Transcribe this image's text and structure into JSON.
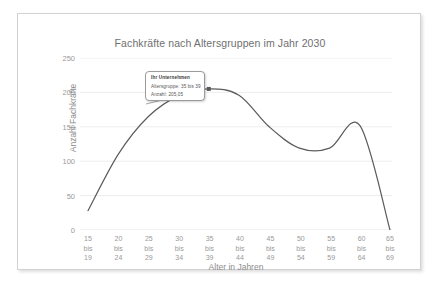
{
  "chart_data": {
    "type": "line",
    "title": "Fachkräfte nach Altersgruppen im Jahr 2030",
    "xlabel": "Alter in Jahren",
    "ylabel": "Anzahl Fachkräfte",
    "categories": [
      "15 bis 19",
      "20 bis 24",
      "25 bis 29",
      "30 bis 34",
      "35 bis 39",
      "40 bis 44",
      "45 bis 49",
      "50 bis 54",
      "55 bis 59",
      "60 bis 64",
      "65 bis 69"
    ],
    "category_lines": [
      [
        "15",
        "bis",
        "19"
      ],
      [
        "20",
        "bis",
        "24"
      ],
      [
        "25",
        "bis",
        "29"
      ],
      [
        "30",
        "bis",
        "34"
      ],
      [
        "35",
        "bis",
        "39"
      ],
      [
        "40",
        "bis",
        "44"
      ],
      [
        "45",
        "bis",
        "49"
      ],
      [
        "50",
        "bis",
        "54"
      ],
      [
        "55",
        "bis",
        "59"
      ],
      [
        "60",
        "bis",
        "64"
      ],
      [
        "65",
        "bis",
        "69"
      ]
    ],
    "series": [
      {
        "name": "Ihr Unternehmen",
        "values": [
          28,
          110,
          165,
          195,
          205.05,
          196,
          150,
          119,
          119,
          152,
          0
        ]
      }
    ],
    "yticks": [
      0,
      50,
      100,
      150,
      200,
      250
    ],
    "ylim": [
      0,
      250
    ],
    "grid": true,
    "legend": "none",
    "line_color": "#5a5a5a",
    "grid_color": "#ededed",
    "text_color": "#9a9a9a"
  },
  "tooltip": {
    "title": "Ihr Unternehmen",
    "row_altersgruppe": "Altersgruppe: 35 bis 39",
    "row_anzahl": "Anzahl: 205,05",
    "highlight_index": 4
  }
}
